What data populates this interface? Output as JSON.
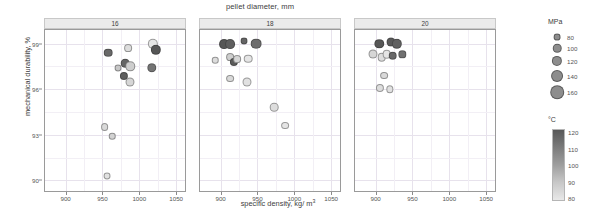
{
  "chart_data": {
    "type": "scatter",
    "title": "pellet diameter, mm",
    "xlabel_main": "specific density, kg/ m",
    "xlabel_exp": "3",
    "ylabel": "mechanical durability, %",
    "xlim": [
      872,
      1062
    ],
    "ylim": [
      89.3,
      99.9
    ],
    "xticks": [
      900,
      950,
      1000,
      1050
    ],
    "xtick_labels": [
      "900",
      "950",
      "1000",
      "1050"
    ],
    "yticks": [
      90,
      93,
      96,
      99
    ],
    "ytick_labels": [
      "90",
      "93",
      "96",
      "99"
    ],
    "grid": true,
    "facet_variable": "pellet diameter, mm",
    "facets": [
      {
        "label": "16",
        "points": [
          {
            "x": 958,
            "y": 98.4,
            "size": 120,
            "temp": 115
          },
          {
            "x": 985,
            "y": 98.7,
            "size": 110,
            "temp": 84
          },
          {
            "x": 1018,
            "y": 99.0,
            "size": 140,
            "temp": 82
          },
          {
            "x": 1022,
            "y": 98.6,
            "size": 140,
            "temp": 120
          },
          {
            "x": 981,
            "y": 97.7,
            "size": 120,
            "temp": 116
          },
          {
            "x": 988,
            "y": 97.5,
            "size": 130,
            "temp": 88
          },
          {
            "x": 971,
            "y": 97.4,
            "size": 100,
            "temp": 90
          },
          {
            "x": 979,
            "y": 96.9,
            "size": 115,
            "temp": 118
          },
          {
            "x": 1017,
            "y": 97.4,
            "size": 130,
            "temp": 112
          },
          {
            "x": 987,
            "y": 96.5,
            "size": 125,
            "temp": 86
          },
          {
            "x": 953,
            "y": 93.5,
            "size": 110,
            "temp": 85
          },
          {
            "x": 963,
            "y": 92.9,
            "size": 95,
            "temp": 87
          },
          {
            "x": 956,
            "y": 90.3,
            "size": 100,
            "temp": 83
          }
        ]
      },
      {
        "label": "18",
        "points": [
          {
            "x": 905,
            "y": 99.0,
            "size": 135,
            "temp": 120
          },
          {
            "x": 913,
            "y": 99.0,
            "size": 135,
            "temp": 118
          },
          {
            "x": 932,
            "y": 99.2,
            "size": 100,
            "temp": 116
          },
          {
            "x": 948,
            "y": 99.0,
            "size": 145,
            "temp": 114
          },
          {
            "x": 893,
            "y": 97.9,
            "size": 95,
            "temp": 84
          },
          {
            "x": 913,
            "y": 98.1,
            "size": 110,
            "temp": 88
          },
          {
            "x": 918,
            "y": 97.8,
            "size": 115,
            "temp": 119
          },
          {
            "x": 922,
            "y": 98.0,
            "size": 110,
            "temp": 86
          },
          {
            "x": 937,
            "y": 98.0,
            "size": 120,
            "temp": 82
          },
          {
            "x": 913,
            "y": 96.7,
            "size": 110,
            "temp": 85
          },
          {
            "x": 936,
            "y": 96.5,
            "size": 125,
            "temp": 83
          },
          {
            "x": 973,
            "y": 94.8,
            "size": 120,
            "temp": 84
          },
          {
            "x": 988,
            "y": 93.6,
            "size": 110,
            "temp": 82
          }
        ]
      },
      {
        "label": "20",
        "points": [
          {
            "x": 905,
            "y": 99.0,
            "size": 130,
            "temp": 120
          },
          {
            "x": 921,
            "y": 99.1,
            "size": 125,
            "temp": 119
          },
          {
            "x": 929,
            "y": 99.0,
            "size": 140,
            "temp": 117
          },
          {
            "x": 897,
            "y": 98.3,
            "size": 125,
            "temp": 86
          },
          {
            "x": 908,
            "y": 98.1,
            "size": 120,
            "temp": 84
          },
          {
            "x": 915,
            "y": 98.3,
            "size": 120,
            "temp": 82
          },
          {
            "x": 923,
            "y": 98.2,
            "size": 120,
            "temp": 115
          },
          {
            "x": 936,
            "y": 98.3,
            "size": 105,
            "temp": 113
          },
          {
            "x": 911,
            "y": 96.9,
            "size": 110,
            "temp": 85
          },
          {
            "x": 906,
            "y": 96.1,
            "size": 115,
            "temp": 84
          },
          {
            "x": 919,
            "y": 96.0,
            "size": 105,
            "temp": 83
          }
        ]
      }
    ]
  },
  "legends": {
    "size": {
      "title": "MPa",
      "entries": [
        {
          "label": "80",
          "value": 80
        },
        {
          "label": "100",
          "value": 100
        },
        {
          "label": "120",
          "value": 120
        },
        {
          "label": "140",
          "value": 140
        },
        {
          "label": "160",
          "value": 160
        }
      ]
    },
    "color": {
      "title": "°C",
      "ticks": [
        "120",
        "110",
        "100",
        "90",
        "80"
      ],
      "range": [
        80,
        120
      ],
      "high_color": "#585858",
      "low_color": "#e8e8e8"
    }
  }
}
